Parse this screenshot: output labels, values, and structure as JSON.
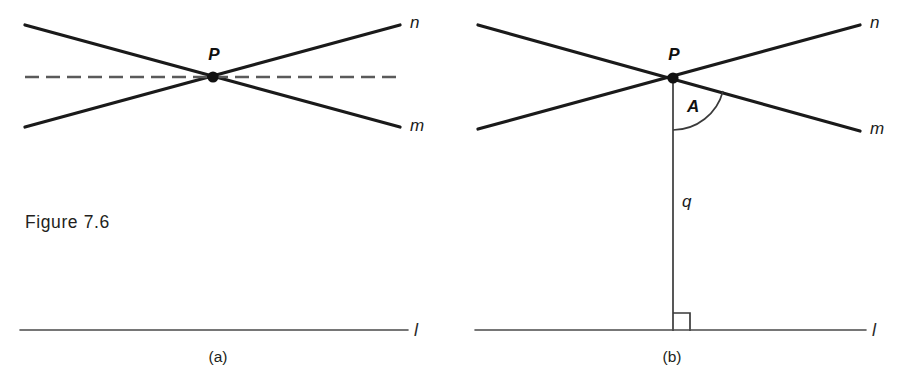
{
  "figure": {
    "caption": "Figure 7.6",
    "background_color": "#ffffff",
    "ink_color": "#111111"
  },
  "panels": [
    {
      "id": "a",
      "caption": "(a)",
      "caption_x": 218,
      "caption_y": 362,
      "point_label": "P",
      "point_label_x": 214,
      "point_label_y": 60,
      "labels": {
        "line_n": "n",
        "line_m": "m",
        "line_l": "l"
      },
      "geometry": {
        "vertex": {
          "x": 213,
          "y": 77
        },
        "ray_n": {
          "x1": 25,
          "y1": 127,
          "x2": 400,
          "y2": 25
        },
        "ray_m": {
          "x1": 25,
          "y1": 25,
          "x2": 400,
          "y2": 127
        },
        "dashed": {
          "x1": 25,
          "y1": 77,
          "x2": 403,
          "y2": 77
        },
        "line_l": {
          "x1": 20,
          "y1": 330,
          "x2": 408,
          "y2": 330
        }
      },
      "label_positions": {
        "n": {
          "x": 410,
          "y": 28
        },
        "m": {
          "x": 410,
          "y": 131
        },
        "l": {
          "x": 414,
          "y": 336
        }
      }
    },
    {
      "id": "b",
      "caption": "(b)",
      "caption_x": 672,
      "caption_y": 362,
      "point_label": "P",
      "point_label_x": 674,
      "point_label_y": 60,
      "angle_label": "A",
      "segment_label": "q",
      "labels": {
        "line_n": "n",
        "line_m": "m",
        "line_l": "l"
      },
      "geometry": {
        "vertex": {
          "x": 673,
          "y": 78
        },
        "ray_n": {
          "x1": 478,
          "y1": 129,
          "x2": 860,
          "y2": 25
        },
        "ray_m": {
          "x1": 478,
          "y1": 25,
          "x2": 860,
          "y2": 131
        },
        "segment_q": {
          "x1": 673,
          "y1": 78,
          "x2": 673,
          "y2": 331
        },
        "line_l": {
          "x1": 475,
          "y1": 330,
          "x2": 866,
          "y2": 330
        },
        "angle_arc": {
          "center_x": 673,
          "center_y": 78,
          "radius": 52,
          "start_angle_deg": 90,
          "end_angle_deg": 15
        },
        "right_angle_square": {
          "x": 673,
          "y": 313,
          "size": 17
        }
      },
      "label_positions": {
        "n": {
          "x": 870,
          "y": 28
        },
        "m": {
          "x": 870,
          "y": 134
        },
        "l": {
          "x": 872,
          "y": 336
        },
        "A": {
          "x": 687,
          "y": 112
        },
        "q": {
          "x": 682,
          "y": 207
        }
      }
    }
  ]
}
